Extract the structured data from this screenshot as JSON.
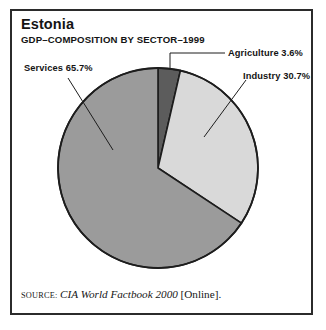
{
  "figure": {
    "title": "Estonia",
    "subtitle": "GDP–COMPOSITION BY SECTOR–1999",
    "frame_color": "#2b2b2b",
    "background": "#ffffff"
  },
  "source": {
    "kicker": "SOURCE:",
    "work": "CIA World Factbook 2000",
    "medium": "[Online]."
  },
  "callouts": {
    "agriculture": "Agriculture 3.6%",
    "industry": "Industry 30.7%",
    "services": "Services 65.7%"
  },
  "chart_data": {
    "type": "pie",
    "title": "Estonia",
    "subtitle": "GDP–COMPOSITION BY SECTOR–1999",
    "xlabel": "",
    "ylabel": "",
    "categories": [
      "Agriculture",
      "Industry",
      "Services"
    ],
    "values": [
      3.6,
      30.7,
      65.7
    ],
    "value_unit": "percent",
    "labels": [
      "Agriculture 3.6%",
      "Industry 30.7%",
      "Services 65.7%"
    ],
    "colors": [
      "#5c5c5c",
      "#d9d9d9",
      "#9b9b9b"
    ],
    "slice_outline": "#1d1d1d",
    "start_angle_deg": 0,
    "direction": "clockwise",
    "legend": "callout-labels",
    "grid": false,
    "center": [
      158,
      168
    ],
    "radius": 100
  }
}
